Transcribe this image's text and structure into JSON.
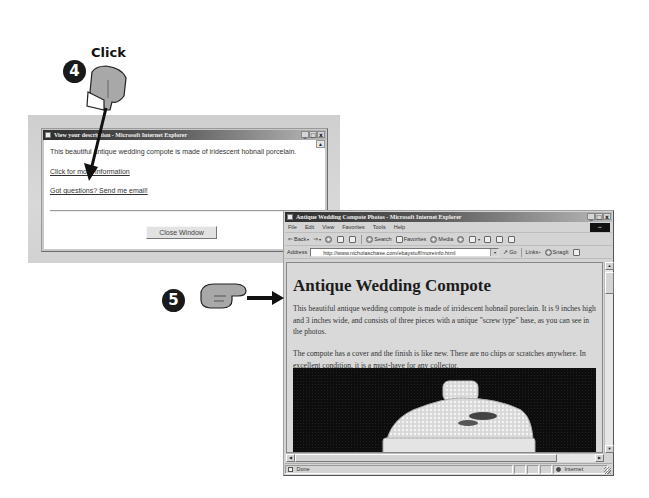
{
  "callouts": {
    "step4": {
      "number": "4",
      "label": "Click"
    },
    "step5": {
      "number": "5"
    }
  },
  "popup_window": {
    "title": "View your description - Microsoft Internet Explorer",
    "controls": {
      "minimize": "_",
      "maximize": "□",
      "close": "x"
    },
    "body_text": "This beautiful antique wedding compote is made of iridescent hobnail porcelain.",
    "links": [
      {
        "label": "Click for more information"
      },
      {
        "label": "Got questions? Send me email!"
      }
    ],
    "close_button": "Close Window",
    "scroll_up": "▲"
  },
  "browser": {
    "title": "Antique Wedding Compote Photos - Microsoft Internet Explorer",
    "controls": {
      "minimize": "_",
      "maximize": "□",
      "close": "x"
    },
    "menu": [
      "File",
      "Edit",
      "View",
      "Favorites",
      "Tools",
      "Help"
    ],
    "toolbar": {
      "back": "Back",
      "forward": "⇒",
      "search": "Search",
      "favorites": "Favorites",
      "media": "Media",
      "caret": "▾"
    },
    "address": {
      "label": "Address",
      "url": "http://www.nicholaschase.com/ebaystuff/moreinfo.html",
      "dropdown": "▾",
      "go": "Go",
      "links": "Links",
      "links_chevron": "»",
      "snagit": "SnagIt"
    },
    "page": {
      "heading": "Antique Wedding Compote",
      "paragraphs": [
        "This beautiful antique wedding compote is made of irridescent hobnail poreclain. It is 9 inches high and 3 inches wide, and consists of three pieces with a unique \"screw type\" base, as you can see in the photos.",
        "The compote has a cover and the finish is like new. There are no chips or scratches anywhere. In excellent condition, it is a must-have for any collector."
      ],
      "photo_alt": "antique hobnail wedding compote lid"
    },
    "scrollbar": {
      "up": "▲",
      "down": "▼",
      "left": "◀",
      "right": "▶"
    },
    "status": {
      "text": "Done",
      "zone": "Internet"
    }
  },
  "colors": {
    "titlebar_dark": "#2e2e2e",
    "titlebar_light": "#b9b9b9",
    "chrome": "#d4d4d4",
    "page_bg": "#d9d9d9",
    "badge": "#1a1a1a"
  }
}
